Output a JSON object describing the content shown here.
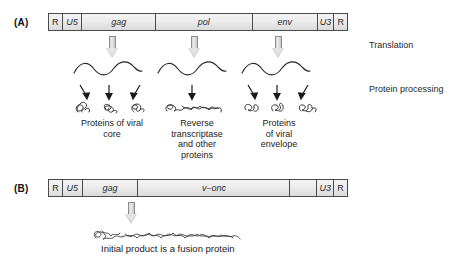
{
  "figure": {
    "panels": [
      {
        "label": "(A)",
        "genome": {
          "segments": [
            {
              "name": "R",
              "style": "plain"
            },
            {
              "name": "U5",
              "style": "italic"
            },
            {
              "name": "gag",
              "style": "italic"
            },
            {
              "name": "pol",
              "style": "italic"
            },
            {
              "name": "env",
              "style": "italic"
            },
            {
              "name": "U3",
              "style": "italic"
            },
            {
              "name": "R",
              "style": "plain"
            }
          ]
        },
        "steps": [
          {
            "label": "Translation"
          },
          {
            "label": "Protein processing"
          }
        ],
        "products": [
          {
            "caption": "Proteins of viral\ncore",
            "arrows": 3
          },
          {
            "caption": "Reverse\ntranscriptase\nand other\nproteins",
            "arrows": 1
          },
          {
            "caption": "Proteins\nof viral\nenvelope",
            "arrows": 3
          }
        ]
      },
      {
        "label": "(B)",
        "genome": {
          "segments": [
            {
              "name": "R",
              "style": "plain"
            },
            {
              "name": "U5",
              "style": "italic"
            },
            {
              "name": "gag",
              "style": "italic"
            },
            {
              "name": "v–onc",
              "style": "italic"
            },
            {
              "name": "",
              "style": "blank"
            },
            {
              "name": "U3",
              "style": "italic"
            },
            {
              "name": "R",
              "style": "plain"
            }
          ]
        },
        "caption": "Initial product is a fusion protein"
      }
    ]
  },
  "colors": {
    "bar_border": "#4a4a4a",
    "bar_fill_top": "#f4f4f4",
    "bar_fill_bottom": "#dadada",
    "arrow_gray": "#cdcdcd",
    "text": "#1a1a1a"
  }
}
